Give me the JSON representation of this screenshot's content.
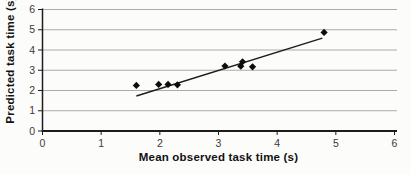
{
  "figure": {
    "background": "#fcfcfb"
  },
  "chart_data": {
    "type": "scatter",
    "title": "",
    "xlabel": "Mean observed task time (s)",
    "ylabel": "Predicted task time (s)",
    "xlim": [
      0,
      6
    ],
    "ylim": [
      0,
      6
    ],
    "x_ticks": [
      0,
      1,
      2,
      3,
      4,
      5,
      6
    ],
    "y_ticks": [
      0,
      1,
      2,
      3,
      4,
      5,
      6
    ],
    "grid": "horizontal-only",
    "legend": "none",
    "marker": "diamond",
    "points": [
      {
        "x": 1.6,
        "y": 2.25
      },
      {
        "x": 1.98,
        "y": 2.3
      },
      {
        "x": 2.14,
        "y": 2.3
      },
      {
        "x": 2.3,
        "y": 2.28
      },
      {
        "x": 3.11,
        "y": 3.21
      },
      {
        "x": 3.38,
        "y": 3.2
      },
      {
        "x": 3.41,
        "y": 3.42
      },
      {
        "x": 3.58,
        "y": 3.17
      },
      {
        "x": 4.8,
        "y": 4.87
      }
    ],
    "trendline": {
      "x1": 1.6,
      "y1": 1.73,
      "x2": 4.77,
      "y2": 4.59
    },
    "colors": {
      "marker": "#0d0d0d",
      "trend_line": "#1c1c1c",
      "grid_line": "#ababab",
      "axis_line": "#1c1c1c",
      "tick_label": "#3a3a3a",
      "axis_title": "#121212",
      "background": "#fcfcfb"
    }
  }
}
